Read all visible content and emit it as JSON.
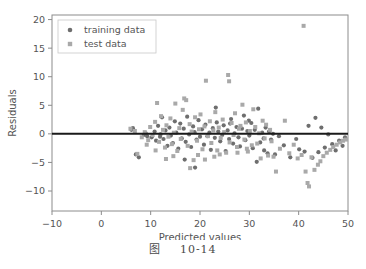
{
  "figure": {
    "caption_label": "图",
    "caption_number": "10-14"
  },
  "chart_data": {
    "type": "scatter",
    "title": "",
    "xlabel": "Predicted values",
    "ylabel": "Residuals",
    "xlim": [
      -10,
      50
    ],
    "ylim": [
      -13.5,
      20.8
    ],
    "xticks": [
      -10,
      0,
      10,
      20,
      30,
      40,
      50
    ],
    "yticks": [
      -10,
      -5,
      0,
      5,
      10,
      15,
      20
    ],
    "grid": false,
    "legend_position": "upper left",
    "reference_line": {
      "type": "hline",
      "y": 0,
      "color": "#1a1a1a",
      "width": 2
    },
    "colors": {
      "training": "#6e6e6e",
      "test": "#a9a9a9",
      "axis": "#8c8c8c",
      "text": "#555555"
    },
    "series": [
      {
        "name": "training data",
        "marker": "circle",
        "color": "#6e6e6e",
        "points": [
          [
            6.1,
            0.7
          ],
          [
            6.4,
            1.0
          ],
          [
            7.0,
            -3.6
          ],
          [
            7.6,
            -4.1
          ],
          [
            8.6,
            -0.2
          ],
          [
            9.0,
            0.1
          ],
          [
            9.3,
            -0.4
          ],
          [
            10.2,
            -0.6
          ],
          [
            10.8,
            0.4
          ],
          [
            11.1,
            -1.2
          ],
          [
            11.5,
            1.4
          ],
          [
            11.9,
            -0.5
          ],
          [
            12.3,
            2.9
          ],
          [
            12.6,
            -0.9
          ],
          [
            13.0,
            0.6
          ],
          [
            13.4,
            -2.1
          ],
          [
            13.8,
            1.1
          ],
          [
            14.1,
            -0.3
          ],
          [
            14.5,
            -1.6
          ],
          [
            14.9,
            2.2
          ],
          [
            15.2,
            0.2
          ],
          [
            15.6,
            -2.6
          ],
          [
            16.0,
            1.8
          ],
          [
            16.3,
            -0.8
          ],
          [
            16.7,
            0.9
          ],
          [
            17.1,
            -1.4
          ],
          [
            17.4,
            3.0
          ],
          [
            17.8,
            -0.1
          ],
          [
            18.2,
            -2.3
          ],
          [
            18.6,
            1.3
          ],
          [
            18.9,
            0.3
          ],
          [
            19.3,
            -1.0
          ],
          [
            19.7,
            2.4
          ],
          [
            20.0,
            -0.5
          ],
          [
            20.4,
            0.8
          ],
          [
            20.8,
            -1.9
          ],
          [
            21.1,
            1.6
          ],
          [
            21.5,
            -0.4
          ],
          [
            21.9,
            0.2
          ],
          [
            22.2,
            -2.8
          ],
          [
            22.6,
            1.0
          ],
          [
            23.0,
            -0.7
          ],
          [
            23.4,
            2.0
          ],
          [
            23.7,
            0.4
          ],
          [
            24.1,
            -1.3
          ],
          [
            24.5,
            -0.2
          ],
          [
            24.8,
            1.5
          ],
          [
            25.2,
            -3.0
          ],
          [
            25.6,
            0.6
          ],
          [
            25.9,
            -0.9
          ],
          [
            26.3,
            2.6
          ],
          [
            26.7,
            -1.7
          ],
          [
            27.0,
            0.1
          ],
          [
            27.4,
            1.2
          ],
          [
            27.8,
            -0.6
          ],
          [
            28.1,
            -2.2
          ],
          [
            28.5,
            0.9
          ],
          [
            28.9,
            3.2
          ],
          [
            29.2,
            -1.1
          ],
          [
            29.6,
            0.5
          ],
          [
            30.0,
            -0.3
          ],
          [
            30.4,
            1.9
          ],
          [
            30.7,
            -2.5
          ],
          [
            31.1,
            0.7
          ],
          [
            31.5,
            -4.9
          ],
          [
            31.8,
            4.4
          ],
          [
            32.2,
            -1.5
          ],
          [
            32.6,
            0.2
          ],
          [
            32.9,
            -0.8
          ],
          [
            33.3,
            1.1
          ],
          [
            33.7,
            -3.4
          ],
          [
            34.0,
            0.4
          ],
          [
            34.4,
            -1.0
          ],
          [
            34.8,
            0.0
          ],
          [
            35.2,
            -3.6
          ],
          [
            36.0,
            -0.4
          ],
          [
            37.0,
            -2.0
          ],
          [
            38.3,
            -4.1
          ],
          [
            39.5,
            -0.9
          ],
          [
            40.1,
            -2.7
          ],
          [
            41.2,
            -3.1
          ],
          [
            42.0,
            1.4
          ],
          [
            42.8,
            -4.2
          ],
          [
            43.4,
            2.8
          ],
          [
            44.0,
            -3.2
          ],
          [
            44.6,
            1.1
          ],
          [
            45.3,
            -2.4
          ],
          [
            46.0,
            -0.1
          ],
          [
            46.8,
            -1.8
          ],
          [
            47.5,
            -2.9
          ],
          [
            48.2,
            -1.2
          ],
          [
            48.9,
            -2.1
          ],
          [
            49.4,
            -0.6
          ],
          [
            12.0,
            -0.1
          ],
          [
            16.9,
            -4.5
          ],
          [
            19.0,
            -5.9
          ],
          [
            23.2,
            4.6
          ],
          [
            26.1,
            1.8
          ],
          [
            29.9,
            2.3
          ],
          [
            33.0,
            -2.9
          ]
        ]
      },
      {
        "name": "test data",
        "marker": "square",
        "color": "#a9a9a9",
        "points": [
          [
            5.9,
            0.9
          ],
          [
            6.8,
            0.5
          ],
          [
            7.3,
            -3.5
          ],
          [
            8.2,
            -0.6
          ],
          [
            8.8,
            0.3
          ],
          [
            9.5,
            -1.1
          ],
          [
            9.9,
            1.2
          ],
          [
            10.4,
            -0.2
          ],
          [
            10.9,
            2.1
          ],
          [
            11.3,
            5.4
          ],
          [
            11.7,
            -1.4
          ],
          [
            12.1,
            3.1
          ],
          [
            12.5,
            0.7
          ],
          [
            12.9,
            -2.4
          ],
          [
            13.2,
            1.5
          ],
          [
            13.6,
            -0.5
          ],
          [
            14.0,
            2.7
          ],
          [
            14.3,
            -1.8
          ],
          [
            14.7,
            0.2
          ],
          [
            15.0,
            5.3
          ],
          [
            15.4,
            -3.0
          ],
          [
            15.8,
            1.0
          ],
          [
            16.1,
            -0.9
          ],
          [
            16.5,
            4.2
          ],
          [
            16.8,
            6.2
          ],
          [
            17.2,
            5.9
          ],
          [
            17.5,
            -2.1
          ],
          [
            17.9,
            1.7
          ],
          [
            18.3,
            0.4
          ],
          [
            18.7,
            -4.6
          ],
          [
            19.0,
            2.9
          ],
          [
            19.4,
            -1.2
          ],
          [
            19.8,
            0.8
          ],
          [
            20.1,
            3.4
          ],
          [
            20.5,
            -2.7
          ],
          [
            20.9,
            1.3
          ],
          [
            21.2,
            9.3
          ],
          [
            21.6,
            -0.4
          ],
          [
            22.0,
            2.2
          ],
          [
            22.3,
            -1.6
          ],
          [
            22.7,
            0.6
          ],
          [
            23.1,
            3.8
          ],
          [
            23.5,
            -2.9
          ],
          [
            23.8,
            1.1
          ],
          [
            24.2,
            -0.7
          ],
          [
            24.6,
            2.5
          ],
          [
            24.9,
            0.3
          ],
          [
            25.3,
            -3.3
          ],
          [
            25.7,
            10.3
          ],
          [
            25.9,
            9.2
          ],
          [
            26.0,
            -1.5
          ],
          [
            26.4,
            1.9
          ],
          [
            26.8,
            -0.2
          ],
          [
            27.1,
            3.6
          ],
          [
            27.5,
            -2.3
          ],
          [
            27.9,
            0.9
          ],
          [
            28.2,
            1.4
          ],
          [
            28.6,
            5.1
          ],
          [
            29.0,
            -1.0
          ],
          [
            29.3,
            2.0
          ],
          [
            29.7,
            -3.1
          ],
          [
            30.1,
            0.5
          ],
          [
            30.5,
            -2.0
          ],
          [
            30.8,
            4.3
          ],
          [
            31.2,
            1.2
          ],
          [
            31.6,
            -1.7
          ],
          [
            32.0,
            0.1
          ],
          [
            32.3,
            -4.3
          ],
          [
            32.7,
            2.3
          ],
          [
            33.1,
            -0.8
          ],
          [
            33.4,
            1.6
          ],
          [
            33.8,
            -3.8
          ],
          [
            34.2,
            0.7
          ],
          [
            34.5,
            -1.3
          ],
          [
            34.9,
            -4.0
          ],
          [
            35.4,
            -6.6
          ],
          [
            36.2,
            -2.6
          ],
          [
            37.2,
            2.3
          ],
          [
            38.1,
            -3.4
          ],
          [
            39.0,
            -1.9
          ],
          [
            39.8,
            -4.3
          ],
          [
            40.6,
            -3.7
          ],
          [
            41.0,
            18.9
          ],
          [
            41.4,
            -6.6
          ],
          [
            41.8,
            -8.6
          ],
          [
            42.1,
            -9.2
          ],
          [
            42.6,
            -4.1
          ],
          [
            43.2,
            -6.3
          ],
          [
            43.9,
            -5.4
          ],
          [
            44.4,
            -4.8
          ],
          [
            45.0,
            -3.9
          ],
          [
            45.7,
            -3.3
          ],
          [
            46.4,
            -2.8
          ],
          [
            47.0,
            -2.3
          ],
          [
            47.7,
            -1.9
          ],
          [
            48.4,
            -1.5
          ],
          [
            49.0,
            -1.2
          ],
          [
            49.6,
            -1.0
          ],
          [
            13.1,
            -4.4
          ],
          [
            14.6,
            -3.9
          ],
          [
            18.0,
            -6.0
          ],
          [
            21.0,
            -4.5
          ],
          [
            24.0,
            -3.6
          ],
          [
            27.6,
            -3.3
          ],
          [
            29.5,
            -2.6
          ],
          [
            11.0,
            -2.9
          ],
          [
            9.2,
            -1.9
          ],
          [
            19.6,
            -3.7
          ],
          [
            22.9,
            -4.0
          ]
        ]
      }
    ]
  }
}
